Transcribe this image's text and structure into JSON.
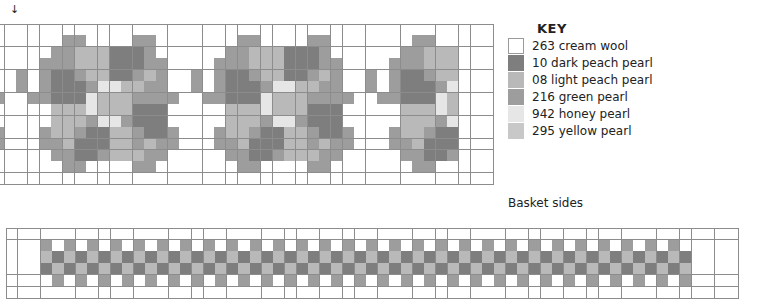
{
  "colors": {
    "W": "#ffffff",
    "D": "#7e7e7e",
    "L": "#b9b9b9",
    "G": "#9d9d9d",
    "H": "#e6e6e6",
    "Y": "#c8c8c8",
    "grid_line": "#8c8c8c"
  },
  "start_marker": "↓",
  "key": {
    "title": "KEY",
    "items": [
      {
        "code": "W",
        "label": "263 cream wool",
        "color": "#ffffff"
      },
      {
        "code": "D",
        "label": "10 dark peach pearl",
        "color": "#7e7e7e"
      },
      {
        "code": "L",
        "label": "08 light peach pearl",
        "color": "#b9b9b9"
      },
      {
        "code": "G",
        "label": "216 green pearl",
        "color": "#9d9d9d"
      },
      {
        "code": "H",
        "label": "942 honey pearl",
        "color": "#e6e6e6"
      },
      {
        "code": "Y",
        "label": "295 yellow pearl",
        "color": "#c8c8c8"
      }
    ]
  },
  "charts": {
    "basket_sides": {
      "caption": "Basket sides",
      "motif_period": 15,
      "motif_rows": [
        "WWWWWWWWWWWWWWW",
        "WWWWGGWWWWGGWWW",
        "WWWGGLLLDDDGWWW",
        "WWGGGLLLDDDGGWW",
        "GWGDDGLLDDGLGWW",
        "GWGDDDGHHLLGGWW",
        "WGGDDDHLLLGGGGW",
        "WWWLLLHLLLDDDWW",
        "WWWLLLGHHGDDDWW",
        "WWGLLGDDLLGDDGW",
        "WWGGLDDDLLGLGGW",
        "WWWGGDDGLLLGGWW",
        "WWWWGGWWWWGGWWW",
        "WWWWWWWWWWWWWWW"
      ],
      "columns": 43,
      "rows": 14,
      "pattern_start_col": 2,
      "pattern_end_col": 38
    },
    "handle": {
      "caption": "Handle",
      "columns": 63,
      "rows": 6,
      "pattern_start_col": 3,
      "pattern_end_col": 58,
      "repeat_rows": [
        "WW",
        "GW",
        "LD",
        "DL",
        "WG",
        "WW"
      ]
    }
  }
}
